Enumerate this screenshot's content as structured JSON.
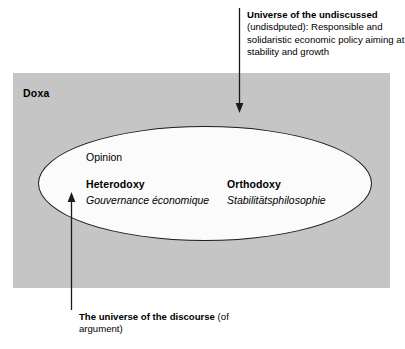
{
  "figure": {
    "doxa_label": "Doxa",
    "background_color": "#c5c5c5",
    "ellipse_fill": "#fbfbfb",
    "ellipse_stroke": "#1b1b1b"
  },
  "ellipse_content": {
    "opinion_label": "Opinion",
    "columns": [
      {
        "title": "Heterodoxy",
        "subtitle": "Gouvernance économique"
      },
      {
        "title": "Orthodoxy",
        "subtitle": "Stabilitätsphilosophie"
      }
    ]
  },
  "annotations": {
    "top": {
      "lead": "Universe of the undiscussed",
      "rest": " (undisdputed): Responsible and solidaristic economic policy aiming at stability and growth",
      "arrow_direction": "down"
    },
    "bottom": {
      "lead": "The universe of the discourse",
      "rest": " (of argument)",
      "arrow_direction": "up"
    }
  }
}
